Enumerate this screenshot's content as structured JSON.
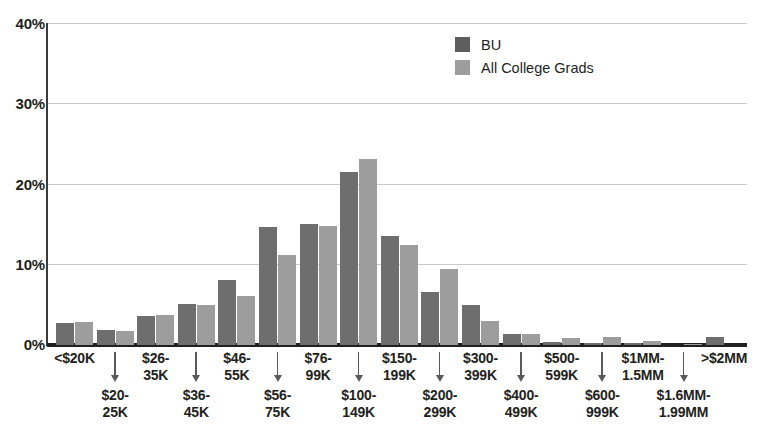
{
  "chart_data": {
    "type": "bar",
    "title": "",
    "xlabel": "",
    "ylabel": "",
    "ylim": [
      0,
      40
    ],
    "yticks": [
      0,
      10,
      20,
      30,
      40
    ],
    "ytick_labels": [
      "0%",
      "10%",
      "20%",
      "30%",
      "40%"
    ],
    "grid": true,
    "legend_position": "top-right",
    "categories": [
      "<$20K",
      "$20-25K",
      "$26-35K",
      "$36-45K",
      "$46-55K",
      "$56-75K",
      "$76-99K",
      "$100-149K",
      "$150-199K",
      "$200-299K",
      "$300-399K",
      "$400-499K",
      "$500-599K",
      "$600-999K",
      "$1MM-1.5MM",
      "$1.6MM-1.99MM",
      ">$2MM"
    ],
    "category_lines": [
      [
        "<$20K"
      ],
      [
        "$20-",
        "25K"
      ],
      [
        "$26-",
        "35K"
      ],
      [
        "$36-",
        "45K"
      ],
      [
        "$46-",
        "55K"
      ],
      [
        "$56-",
        "75K"
      ],
      [
        "$76-",
        "99K"
      ],
      [
        "$100-",
        "149K"
      ],
      [
        "$150-",
        "199K"
      ],
      [
        "$200-",
        "299K"
      ],
      [
        "$300-",
        "399K"
      ],
      [
        "$400-",
        "499K"
      ],
      [
        "$500-",
        "599K"
      ],
      [
        "$600-",
        "999K"
      ],
      [
        "$1MM-",
        "1.5MM"
      ],
      [
        "$1.6MM-",
        "1.99MM"
      ],
      [
        ">$2MM"
      ]
    ],
    "series": [
      {
        "name": "BU",
        "color": "#6e6e6e",
        "values": [
          2.7,
          1.9,
          3.6,
          5.1,
          8.1,
          14.6,
          15.0,
          21.5,
          13.5,
          6.6,
          5.0,
          1.4,
          0.4,
          0.3,
          0.2,
          0.0,
          1.0
        ]
      },
      {
        "name": "All College Grads",
        "color": "#9d9d9d",
        "values": [
          2.9,
          1.8,
          3.7,
          5.0,
          6.1,
          11.2,
          14.8,
          23.1,
          12.4,
          9.5,
          3.0,
          1.4,
          0.9,
          1.0,
          0.5,
          0.1,
          0.0
        ]
      }
    ]
  },
  "legend": {
    "items": [
      {
        "label": "BU",
        "color": "#5e5e5e"
      },
      {
        "label": "All College Grads",
        "color": "#9d9d9d"
      }
    ]
  }
}
